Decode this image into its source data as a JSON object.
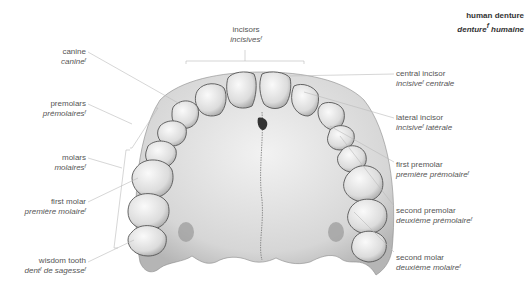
{
  "title": {
    "en": "human denture",
    "fr": "denture",
    "fr_rest": " humaine",
    "gender": "f"
  },
  "labels": {
    "incisors": {
      "en": "incisors",
      "fr": "incisives",
      "fr_rest": "",
      "gender": "f"
    },
    "canine": {
      "en": "canine",
      "fr": "canine",
      "fr_rest": "",
      "gender": "f"
    },
    "premolars": {
      "en": "premolars",
      "fr": "prémolaires",
      "fr_rest": "",
      "gender": "f"
    },
    "molars": {
      "en": "molars",
      "fr": "molaires",
      "fr_rest": "",
      "gender": "f"
    },
    "first_molar": {
      "en": "first molar",
      "fr": "première molaire",
      "fr_rest": "",
      "gender": "f"
    },
    "wisdom_tooth": {
      "en": "wisdom tooth",
      "fr": "dent",
      "fr_rest": " de sagesse",
      "gender": "f",
      "gender2": "f"
    },
    "central_incisor": {
      "en": "central incisor",
      "fr": "incisive",
      "fr_rest": " centrale",
      "gender": "f"
    },
    "lateral_incisor": {
      "en": "lateral incisor",
      "fr": "incisive",
      "fr_rest": " latérale",
      "gender": "f"
    },
    "first_premolar": {
      "en": "first premolar",
      "fr": "première prémolaire",
      "fr_rest": "",
      "gender": "f"
    },
    "second_premolar": {
      "en": "second premolar",
      "fr": "deuxième prémolaire",
      "fr_rest": "",
      "gender": "f"
    },
    "second_molar": {
      "en": "second molar",
      "fr": "deuxième molaire",
      "fr_rest": "",
      "gender": "f"
    }
  },
  "colors": {
    "text": "#555555",
    "leader": "#bbbbbb",
    "tooth": "#e6e6e6",
    "palate": "#d4d4d4",
    "outline": "#555555"
  }
}
